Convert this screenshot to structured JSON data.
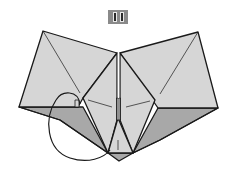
{
  "diagram": {
    "step_number": "11",
    "colors": {
      "paper_light": "#d6d6d6",
      "paper_dark": "#a8a8a8",
      "outline": "#1a1a1a",
      "badge_bg": "#8a8a8a"
    },
    "elements": [
      "step-badge",
      "left-wing",
      "right-wing",
      "center-diamond",
      "bottom-flap",
      "fold-arrow"
    ]
  }
}
